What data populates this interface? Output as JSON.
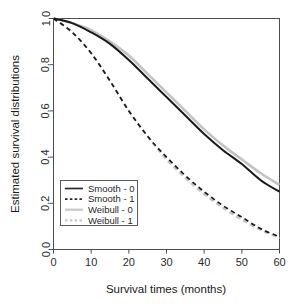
{
  "chart_data": {
    "type": "line",
    "title": "",
    "xlabel": "Survival times (months)",
    "ylabel": "Estimated survival distributions",
    "xlim": [
      0,
      60
    ],
    "ylim": [
      0.0,
      1.0
    ],
    "xticks": [
      0,
      10,
      20,
      30,
      40,
      50,
      60
    ],
    "xtick_labels": [
      "0",
      "10",
      "20",
      "30",
      "40",
      "50",
      "60"
    ],
    "yticks": [
      0.0,
      0.2,
      0.4,
      0.6,
      0.8,
      1.0
    ],
    "ytick_labels": [
      "0.0",
      "0.2",
      "0.4",
      "0.6",
      "0.8",
      "1.0"
    ],
    "grid": false,
    "legend_position": "left-lower",
    "x": [
      0,
      5,
      10,
      15,
      20,
      25,
      30,
      35,
      40,
      45,
      50,
      55,
      60
    ],
    "series": [
      {
        "name": "Smooth - 0",
        "style": "solid",
        "color": "#1a1a1a",
        "width": 2.0,
        "values": [
          1.0,
          0.98,
          0.94,
          0.89,
          0.82,
          0.74,
          0.66,
          0.58,
          0.5,
          0.43,
          0.37,
          0.3,
          0.25
        ]
      },
      {
        "name": "Smooth - 1",
        "style": "dashed",
        "color": "#1a1a1a",
        "width": 1.7,
        "values": [
          1.0,
          0.94,
          0.85,
          0.73,
          0.6,
          0.49,
          0.4,
          0.32,
          0.25,
          0.19,
          0.14,
          0.09,
          0.055
        ]
      },
      {
        "name": "Weibull - 0",
        "style": "solid",
        "color": "#c3c3c3",
        "width": 2.6,
        "values": [
          1.0,
          0.98,
          0.95,
          0.9,
          0.84,
          0.76,
          0.68,
          0.6,
          0.52,
          0.45,
          0.39,
          0.33,
          0.28
        ]
      },
      {
        "name": "Weibull - 1",
        "style": "dashed",
        "color": "#c3c3c3",
        "width": 2.2,
        "values": [
          1.0,
          0.94,
          0.85,
          0.73,
          0.6,
          0.49,
          0.39,
          0.31,
          0.24,
          0.18,
          0.13,
          0.085,
          0.05
        ]
      }
    ],
    "legend": [
      {
        "label": "Smooth - 0",
        "style": "solid",
        "color": "#2a2a2a"
      },
      {
        "label": "Smooth - 1",
        "style": "dashed",
        "color": "#2a2a2a"
      },
      {
        "label": "Weibull - 0",
        "style": "solid",
        "color": "#c9c9c9"
      },
      {
        "label": "Weibull - 1",
        "style": "dashed",
        "color": "#c9c9c9"
      }
    ]
  },
  "axes": {
    "frame_color": "#4d4d4d"
  }
}
